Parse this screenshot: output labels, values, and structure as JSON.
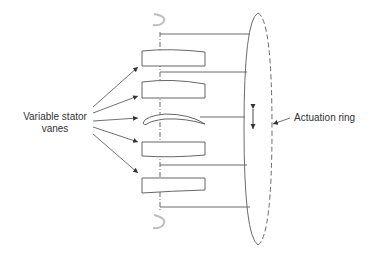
{
  "diagram": {
    "labels": {
      "variable_stator_vanes": "Variable stator vanes",
      "actuation_ring": "Actuation ring"
    },
    "colors": {
      "line": "#6b6b6b",
      "outline": "#555555",
      "text": "#333333",
      "rotation_symbol": "#bdbdbd",
      "background": "#ffffff"
    },
    "components": {
      "vane_count": 5,
      "linkage_rod_count": 5,
      "centerline": "dash-dot pivot axis",
      "actuation_ring": "ellipse, near side solid, far side dashed",
      "movement_indicator": "double-headed vertical arrow",
      "rotation_symbols": 2
    }
  }
}
